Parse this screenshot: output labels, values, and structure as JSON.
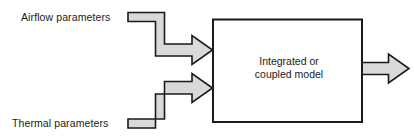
{
  "diagram": {
    "title_fragment": "",
    "colors": {
      "band_fill": "#d9d9d9",
      "band_outline": "#1a1a1a",
      "box_outline": "#1a1a1a",
      "box_fill": "#ffffff",
      "text": "#1a1a1a",
      "background": "#ffffff"
    },
    "inputs": [
      {
        "id": "airflow",
        "label": "Airflow parameters"
      },
      {
        "id": "thermal",
        "label": "Thermal parameters"
      }
    ],
    "process_box": {
      "label_lines": [
        "Integrated or",
        "coupled model"
      ]
    },
    "output": {
      "arrow_name": "output-arrow",
      "label": ""
    },
    "arrows": {
      "airflow_arrow_name": "airflow-input-arrow",
      "thermal_arrow_name": "thermal-input-arrow"
    }
  }
}
